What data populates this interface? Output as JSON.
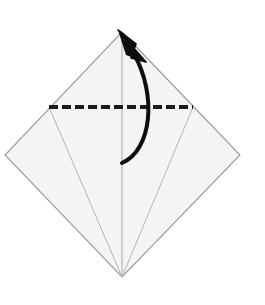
{
  "diagram": {
    "type": "origami-instruction",
    "canvas": {
      "width": 265,
      "height": 305,
      "background": "#ffffff"
    },
    "colors": {
      "paper_fill": "#f4f4f4",
      "paper_edge": "#9a9a9a",
      "crease_line": "#b4b4b4",
      "fold_line": "#1a1a1a",
      "arrow": "#0d0d0d"
    },
    "shapes": {
      "paper": {
        "name": "square-paper-diamond",
        "points": "122,32 240,155 122,277 5,155",
        "vertices": {
          "top": [
            122,
            32
          ],
          "right": [
            240,
            155
          ],
          "bottom": [
            122,
            277
          ],
          "left": [
            5,
            155
          ]
        }
      },
      "crease_center": {
        "name": "center-crease",
        "x1": 122,
        "y1": 32,
        "x2": 122,
        "y2": 277
      },
      "crease_left": {
        "name": "left-crease",
        "x1": 49,
        "y1": 107,
        "x2": 122,
        "y2": 277
      },
      "crease_right": {
        "name": "right-crease",
        "x1": 193,
        "y1": 107,
        "x2": 122,
        "y2": 277
      },
      "fold_line": {
        "name": "valley-fold-dashed-line",
        "style": "dashed",
        "x1": 49,
        "y1": 107,
        "x2": 193,
        "y2": 107,
        "dash": "9 4",
        "thickness": 4.2
      },
      "arrow": {
        "name": "fold-direction-arrow",
        "style": "curved-solid",
        "path": "M 122 163 C 152 150 157 95 134 54",
        "head_points": "118,30 146,62 131,58 136,44",
        "head_tip": [
          118,
          30
        ],
        "thickness": 4.0
      }
    },
    "labels": {
      "step_number": "",
      "caption": ""
    }
  }
}
